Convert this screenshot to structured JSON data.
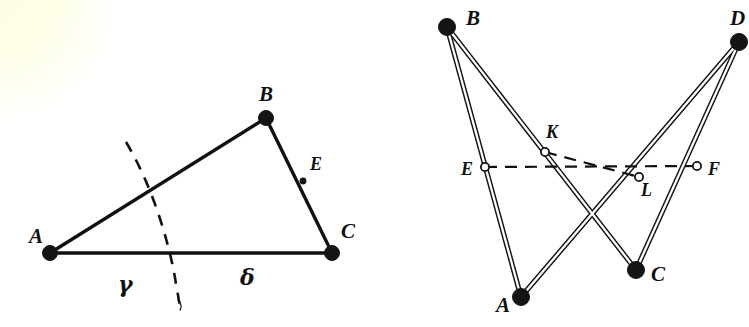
{
  "page": {
    "width": 749,
    "height": 327,
    "background_color": "#ffffff",
    "ink_color": "#111111",
    "paper_tint_color": "#fdfce2"
  },
  "figure_left": {
    "name": "triangle-with-angle-arc",
    "vertices": [
      {
        "id": "A",
        "label": "A",
        "x": 50,
        "y": 253,
        "marker": "filled-disc",
        "label_x": 29,
        "label_y": 243
      },
      {
        "id": "B",
        "label": "B",
        "x": 266,
        "y": 118,
        "marker": "filled-disc",
        "label_x": 259,
        "label_y": 101
      },
      {
        "id": "C",
        "label": "C",
        "x": 332,
        "y": 253,
        "marker": "filled-disc",
        "label_x": 341,
        "label_y": 238
      },
      {
        "id": "E",
        "label": "E",
        "x": 303,
        "y": 181,
        "marker": "small-dot",
        "label_x": 310,
        "label_y": 170
      }
    ],
    "segments": [
      {
        "from": "A",
        "to": "B"
      },
      {
        "from": "B",
        "to": "C"
      },
      {
        "from": "A",
        "to": "C"
      }
    ],
    "arc": {
      "name": "angle-arc-dashed",
      "style": "dashed",
      "path_points": [
        [
          126,
          142
        ],
        [
          152,
          192
        ],
        [
          168,
          238
        ],
        [
          176,
          281
        ],
        [
          180,
          306
        ]
      ]
    },
    "angle_labels": [
      {
        "id": "gamma",
        "label": "γ",
        "x": 118,
        "y": 292
      },
      {
        "id": "delta",
        "label": "δ",
        "x": 240,
        "y": 285
      }
    ]
  },
  "figure_right": {
    "name": "crossed-linkage-quadrilateral",
    "vertices": [
      {
        "id": "B",
        "label": "B",
        "x": 447,
        "y": 27,
        "marker": "filled-disc",
        "label_x": 466,
        "label_y": 25
      },
      {
        "id": "D",
        "label": "D",
        "x": 739,
        "y": 42,
        "marker": "filled-disc",
        "label_x": 730,
        "label_y": 25
      },
      {
        "id": "A",
        "label": "A",
        "x": 521,
        "y": 297,
        "marker": "filled-disc",
        "label_x": 496,
        "label_y": 312
      },
      {
        "id": "C",
        "label": "C",
        "x": 636,
        "y": 270,
        "marker": "filled-disc",
        "label_x": 651,
        "label_y": 281
      }
    ],
    "midpoints": [
      {
        "id": "E",
        "label": "E",
        "x": 485,
        "y": 167,
        "marker": "hollow-circle",
        "label_x": 461,
        "label_y": 175
      },
      {
        "id": "K",
        "label": "K",
        "x": 545,
        "y": 152,
        "marker": "hollow-circle",
        "label_x": 546,
        "label_y": 138
      },
      {
        "id": "L",
        "label": "L",
        "x": 639,
        "y": 177,
        "marker": "hollow-circle",
        "label_x": 641,
        "label_y": 196
      },
      {
        "id": "F",
        "label": "F",
        "x": 697,
        "y": 166,
        "marker": "hollow-circle",
        "label_x": 708,
        "label_y": 175
      }
    ],
    "rods": [
      {
        "name": "rod-B-A",
        "from": "B",
        "to": "A"
      },
      {
        "name": "rod-B-C",
        "from": "B",
        "to": "C"
      },
      {
        "name": "rod-D-C",
        "from": "D",
        "to": "C"
      },
      {
        "name": "rod-D-A",
        "from": "D",
        "to": "A"
      }
    ],
    "dashed_lines": [
      {
        "name": "dashed-E-F",
        "from": "E",
        "to": "F"
      },
      {
        "name": "dashed-K-L",
        "from": "K",
        "to": "L"
      }
    ]
  }
}
